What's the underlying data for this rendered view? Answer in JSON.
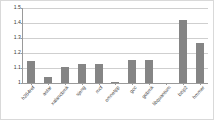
{
  "chart_data": {
    "type": "bar",
    "title": "",
    "xlabel": "",
    "ylabel": "",
    "ylim": [
      1,
      1.5
    ],
    "yticks": [
      "1",
      "1.1",
      "1.2",
      "1.3",
      "1.4",
      "1.5"
    ],
    "ytick_values": [
      1,
      1.1,
      1.2,
      1.3,
      1.4,
      1.5
    ],
    "grid": true,
    "legend": "none",
    "bar_color": "#858585",
    "categories": [
      "h264ref",
      "astar",
      "xalancbmk",
      "sjeng",
      "mcf",
      "omnetpp",
      "gcc",
      "gobmk",
      "libquantum",
      "bzip2",
      "hmmer"
    ],
    "values": [
      1.15,
      1.04,
      1.11,
      1.13,
      1.13,
      1.005,
      1.155,
      1.152,
      1.0,
      1.42,
      1.265
    ]
  },
  "axis": {
    "y_top_label": "1.5",
    "y_base_label": "1"
  }
}
